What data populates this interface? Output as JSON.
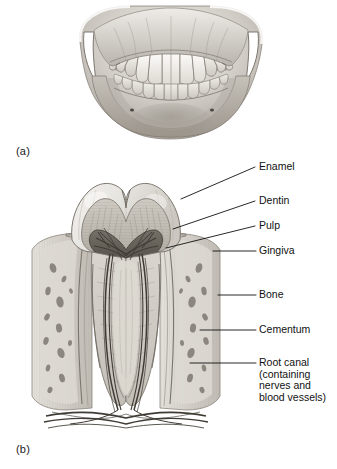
{
  "figure": {
    "type": "anatomical-illustration",
    "style": "grayscale medical line drawing",
    "background_color": "#ffffff"
  },
  "panels": [
    {
      "id": "a",
      "label": "(a)",
      "caption": "",
      "content": "Anterior view of upper and lower jaws with teeth in occlusion"
    },
    {
      "id": "b",
      "label": "(b)",
      "caption": "",
      "content": "Longitudinal cross-section of a molar tooth within alveolar bone"
    }
  ],
  "callouts": [
    {
      "id": "enamel",
      "label": "Enamel",
      "lines": [
        "Enamel"
      ]
    },
    {
      "id": "dentin",
      "label": "Dentin",
      "lines": [
        "Dentin"
      ]
    },
    {
      "id": "pulp",
      "label": "Pulp",
      "lines": [
        "Pulp"
      ]
    },
    {
      "id": "gingiva",
      "label": "Gingiva",
      "lines": [
        "Gingiva"
      ]
    },
    {
      "id": "bone",
      "label": "Bone",
      "lines": [
        "Bone"
      ]
    },
    {
      "id": "cementum",
      "label": "Cementum",
      "lines": [
        "Cementum"
      ]
    },
    {
      "id": "root-canal",
      "label": "Root canal (containing nerves and blood vessels)",
      "lines": [
        "Root canal",
        "(containing",
        "nerves and",
        "blood vessels)"
      ]
    }
  ],
  "callout_text": {
    "enamel": "Enamel",
    "dentin": "Dentin",
    "pulp": "Pulp",
    "gingiva": "Gingiva",
    "bone": "Bone",
    "cementum": "Cementum",
    "root_canal_1": "Root canal",
    "root_canal_2": "(containing",
    "root_canal_3": "nerves and",
    "root_canal_4": "blood vessels)"
  },
  "panel_text": {
    "a": "(a)",
    "b": "(b)"
  },
  "colors": {
    "line": "#111111",
    "text": "#111111",
    "background": "#ffffff",
    "bone_light": "#d8d4cd",
    "bone_mid": "#b9b4ac",
    "enamel": "#e6e4df",
    "dentin": "#c9c5bd",
    "pulp_dark": "#6d6a64",
    "gingiva": "#a9a49c"
  }
}
